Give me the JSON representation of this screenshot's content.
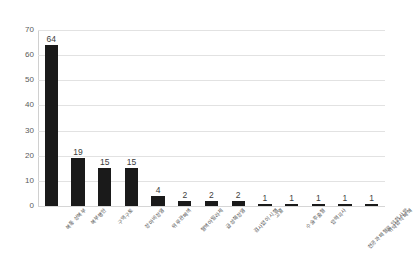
{
  "chart_data": {
    "type": "bar",
    "title": "",
    "subtitle": "",
    "xlabel": "",
    "ylabel": "",
    "ylim": [
      0,
      70
    ],
    "ytick_step": 10,
    "yticks": [
      "70",
      "60",
      "50",
      "40",
      "30",
      "20",
      "10",
      "0"
    ],
    "grid": true,
    "grid_axis": "y",
    "legend": false,
    "legend_position": "none",
    "bar_color": "#1a1a1a",
    "grid_color": "#e2e2e2",
    "axis_color": "#d0d0d0",
    "label_color": "#4a4a4a",
    "value_label_color": "#3d3d3d",
    "categories": [
      "복통 상복부",
      "복부팽만",
      "구역구토",
      "장마비장염",
      "위루관폐색",
      "혈액아밀라제",
      "급성췌장염",
      "검사없이 시행",
      "고열",
      "수술후출혈",
      "압력괴사",
      "천공과 패혈로 인한 사망",
      "위약협착 폐쇄"
    ],
    "values": [
      64,
      19,
      15,
      15,
      4,
      2,
      2,
      2,
      1,
      1,
      1,
      1,
      1
    ],
    "value_labels": [
      "64",
      "19",
      "15",
      "15",
      "4",
      "2",
      "2",
      "2",
      "1",
      "1",
      "1",
      "1",
      "1"
    ]
  }
}
